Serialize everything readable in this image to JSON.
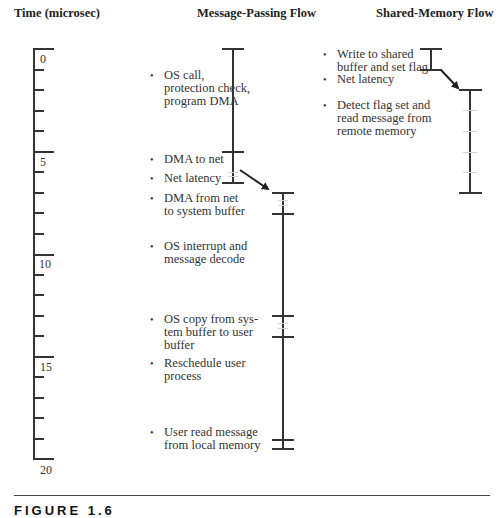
{
  "headers": {
    "time": "Time (microsec)",
    "message_passing": "Message-Passing Flow",
    "shared_memory": "Shared-Memory Flow"
  },
  "axis": {
    "unit": "microsec",
    "min": 0,
    "max": 20,
    "labels": [
      "0",
      "5",
      "10",
      "15",
      "20"
    ]
  },
  "message_passing": {
    "steps": [
      {
        "label": "OS call, protection check, program DMA",
        "lines": [
          "OS call,",
          "protection check,",
          "program DMA"
        ],
        "start": 0,
        "end": 5
      },
      {
        "label": "DMA to net",
        "lines": [
          "DMA to net"
        ],
        "start": 5,
        "end": 6.5
      },
      {
        "label": "Net latency",
        "lines": [
          "Net latency"
        ],
        "start": 6.5,
        "end": 7
      },
      {
        "label": "DMA from net to system buffer",
        "lines": [
          "DMA from net",
          "to system buffer"
        ],
        "start": 7,
        "end": 8
      },
      {
        "label": "OS interrupt and message decode",
        "lines": [
          "OS interrupt and",
          "message decode"
        ],
        "start": 8,
        "end": 13
      },
      {
        "label": "OS copy from system buffer to user buffer",
        "lines": [
          "OS copy from sys-",
          "tem buffer to user",
          "buffer"
        ],
        "start": 13,
        "end": 14
      },
      {
        "label": "Reschedule user process",
        "lines": [
          "Reschedule user",
          "process"
        ],
        "start": 14,
        "end": 19
      },
      {
        "label": "User read message from local memory",
        "lines": [
          "User read message",
          "from local memory"
        ],
        "start": 19,
        "end": 19.5
      }
    ]
  },
  "shared_memory": {
    "steps": [
      {
        "label": "Write to shared buffer and set flag",
        "lines": [
          "Write to shared",
          "buffer and set flag"
        ],
        "start": 0,
        "end": 1
      },
      {
        "label": "Net latency",
        "lines": [
          "Net latency"
        ],
        "start": 1,
        "end": 2
      },
      {
        "label": "Detect flag set and read message from remote memory",
        "lines": [
          "Detect flag set and",
          "read message from",
          "remote memory"
        ],
        "start": 2,
        "end": 7
      }
    ]
  },
  "caption": {
    "text": "FIGURE 1.6"
  }
}
